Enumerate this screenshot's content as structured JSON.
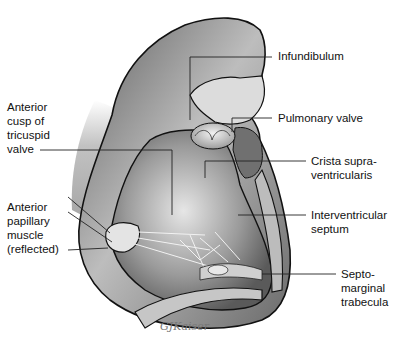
{
  "figure": {
    "signature": "GJKaiser",
    "colors": {
      "background": "#ffffff",
      "outline": "#111111",
      "heart_wall": "#8a8a8a",
      "inner_wall": "#6e6e6e",
      "highlight": "#d8d8d8",
      "leader_line": "#222222"
    }
  },
  "labels": {
    "left": [
      {
        "id": "anterior-cusp",
        "text": "Anterior\ncusp of\ntricuspid\nvalve"
      },
      {
        "id": "anterior-papillary",
        "text": "Anterior\npapillary\nmuscle\n(reflected)"
      }
    ],
    "right": [
      {
        "id": "infundibulum",
        "text": "Infundibulum"
      },
      {
        "id": "pulmonary-valve",
        "text": "Pulmonary valve"
      },
      {
        "id": "crista",
        "text": "Crista supra-\nventricularis"
      },
      {
        "id": "septum",
        "text": "Interventricular\nseptum"
      },
      {
        "id": "trabecula",
        "text": "Septo-\nmarginal\ntrabecula"
      }
    ]
  }
}
